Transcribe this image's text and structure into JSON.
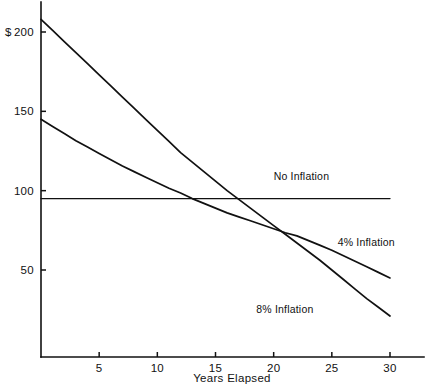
{
  "chart_data": {
    "type": "line",
    "title": "",
    "xlabel": "Years Elapsed",
    "ylabel": "$",
    "y_unit_prefix": "$",
    "xlim": [
      0,
      32
    ],
    "ylim": [
      0,
      215
    ],
    "grid": false,
    "legend_position": "inline-right",
    "xticks": [
      5,
      10,
      15,
      20,
      25,
      30
    ],
    "xtick_labels": [
      "5",
      "10",
      "15",
      "20",
      "25",
      "30"
    ],
    "yticks": [
      50,
      100,
      150,
      200
    ],
    "ytick_labels": [
      "50",
      "100",
      "150",
      "200"
    ],
    "x": [
      0,
      1,
      2,
      3,
      4,
      5,
      6,
      7,
      8,
      9,
      10,
      11,
      12,
      13,
      14,
      15,
      16,
      17,
      18,
      19,
      20,
      21,
      22,
      23,
      24,
      25,
      26,
      27,
      28,
      29,
      30
    ],
    "series": [
      {
        "name": "No Inflation",
        "label": "No Inflation",
        "label_x": 20,
        "label_y": 107,
        "values": [
          95,
          95,
          95,
          95,
          95,
          95,
          95,
          95,
          95,
          95,
          95,
          95,
          95,
          95,
          95,
          95,
          95,
          95,
          95,
          95,
          95,
          95,
          95,
          95,
          95,
          95,
          95,
          95,
          95,
          95,
          95
        ]
      },
      {
        "name": "4% Inflation",
        "label": "4% Inflation",
        "label_x": 25.5,
        "label_y": 65,
        "values": [
          145,
          140.5,
          136,
          131.5,
          127.5,
          123.5,
          119.5,
          115.5,
          112,
          108.5,
          105,
          101.5,
          98.5,
          95,
          92,
          89,
          86,
          83.5,
          81,
          78.5,
          76,
          73.5,
          71.5,
          68.5,
          65.5,
          62.5,
          59,
          55.5,
          52,
          48.5,
          45
        ]
      },
      {
        "name": "8% Inflation",
        "label": "8% Inflation",
        "label_x": 18.5,
        "label_y": 23,
        "values": [
          208,
          201,
          194,
          187,
          180,
          173,
          166,
          159,
          152,
          145,
          138,
          131,
          124,
          118,
          112,
          106,
          100,
          94.5,
          89,
          83.5,
          78,
          72.5,
          67,
          61.5,
          56,
          50,
          44,
          38,
          32,
          26.5,
          21
        ]
      }
    ]
  }
}
